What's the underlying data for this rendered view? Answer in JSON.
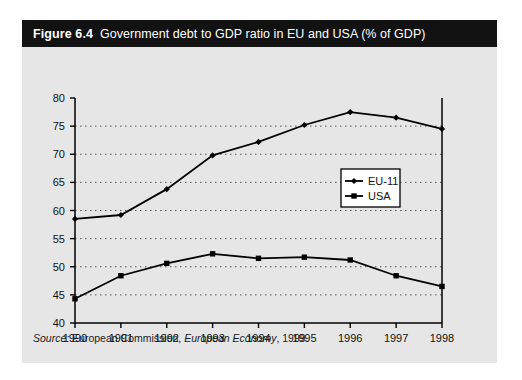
{
  "figure": {
    "number": "Figure 6.4",
    "title": "Government debt to GDP  ratio in EU and USA (% of GDP)",
    "source_label": "Source:",
    "source_org": " European Commission, ",
    "source_pub": "European Economy",
    "source_year": ", 1999."
  },
  "chart_data": {
    "type": "line",
    "title": "Government debt to GDP  ratio in EU and USA (% of GDP)",
    "xlabel": "",
    "ylabel": "",
    "categories": [
      "1990",
      "1991",
      "1992",
      "1993",
      "1994",
      "1995",
      "1996",
      "1997",
      "1998"
    ],
    "x": [
      1990,
      1991,
      1992,
      1993,
      1994,
      1995,
      1996,
      1997,
      1998
    ],
    "xlim": [
      1990,
      1998
    ],
    "ylim": [
      40,
      80
    ],
    "yticks": [
      "40",
      "45",
      "50",
      "55",
      "60",
      "65",
      "70",
      "75",
      "80"
    ],
    "ytick_values": [
      40,
      45,
      50,
      55,
      60,
      65,
      70,
      75,
      80
    ],
    "grid": "horizontal-dotted",
    "legend_position": "center-right",
    "series": [
      {
        "name": "EU-11",
        "marker": "diamond",
        "color": "#000000",
        "values": [
          58.5,
          59.2,
          63.8,
          69.8,
          72.2,
          75.2,
          77.5,
          76.5,
          74.5
        ]
      },
      {
        "name": "USA",
        "marker": "square",
        "color": "#000000",
        "values": [
          44.3,
          48.4,
          50.6,
          52.3,
          51.5,
          51.7,
          51.2,
          48.4,
          46.5
        ]
      }
    ]
  }
}
